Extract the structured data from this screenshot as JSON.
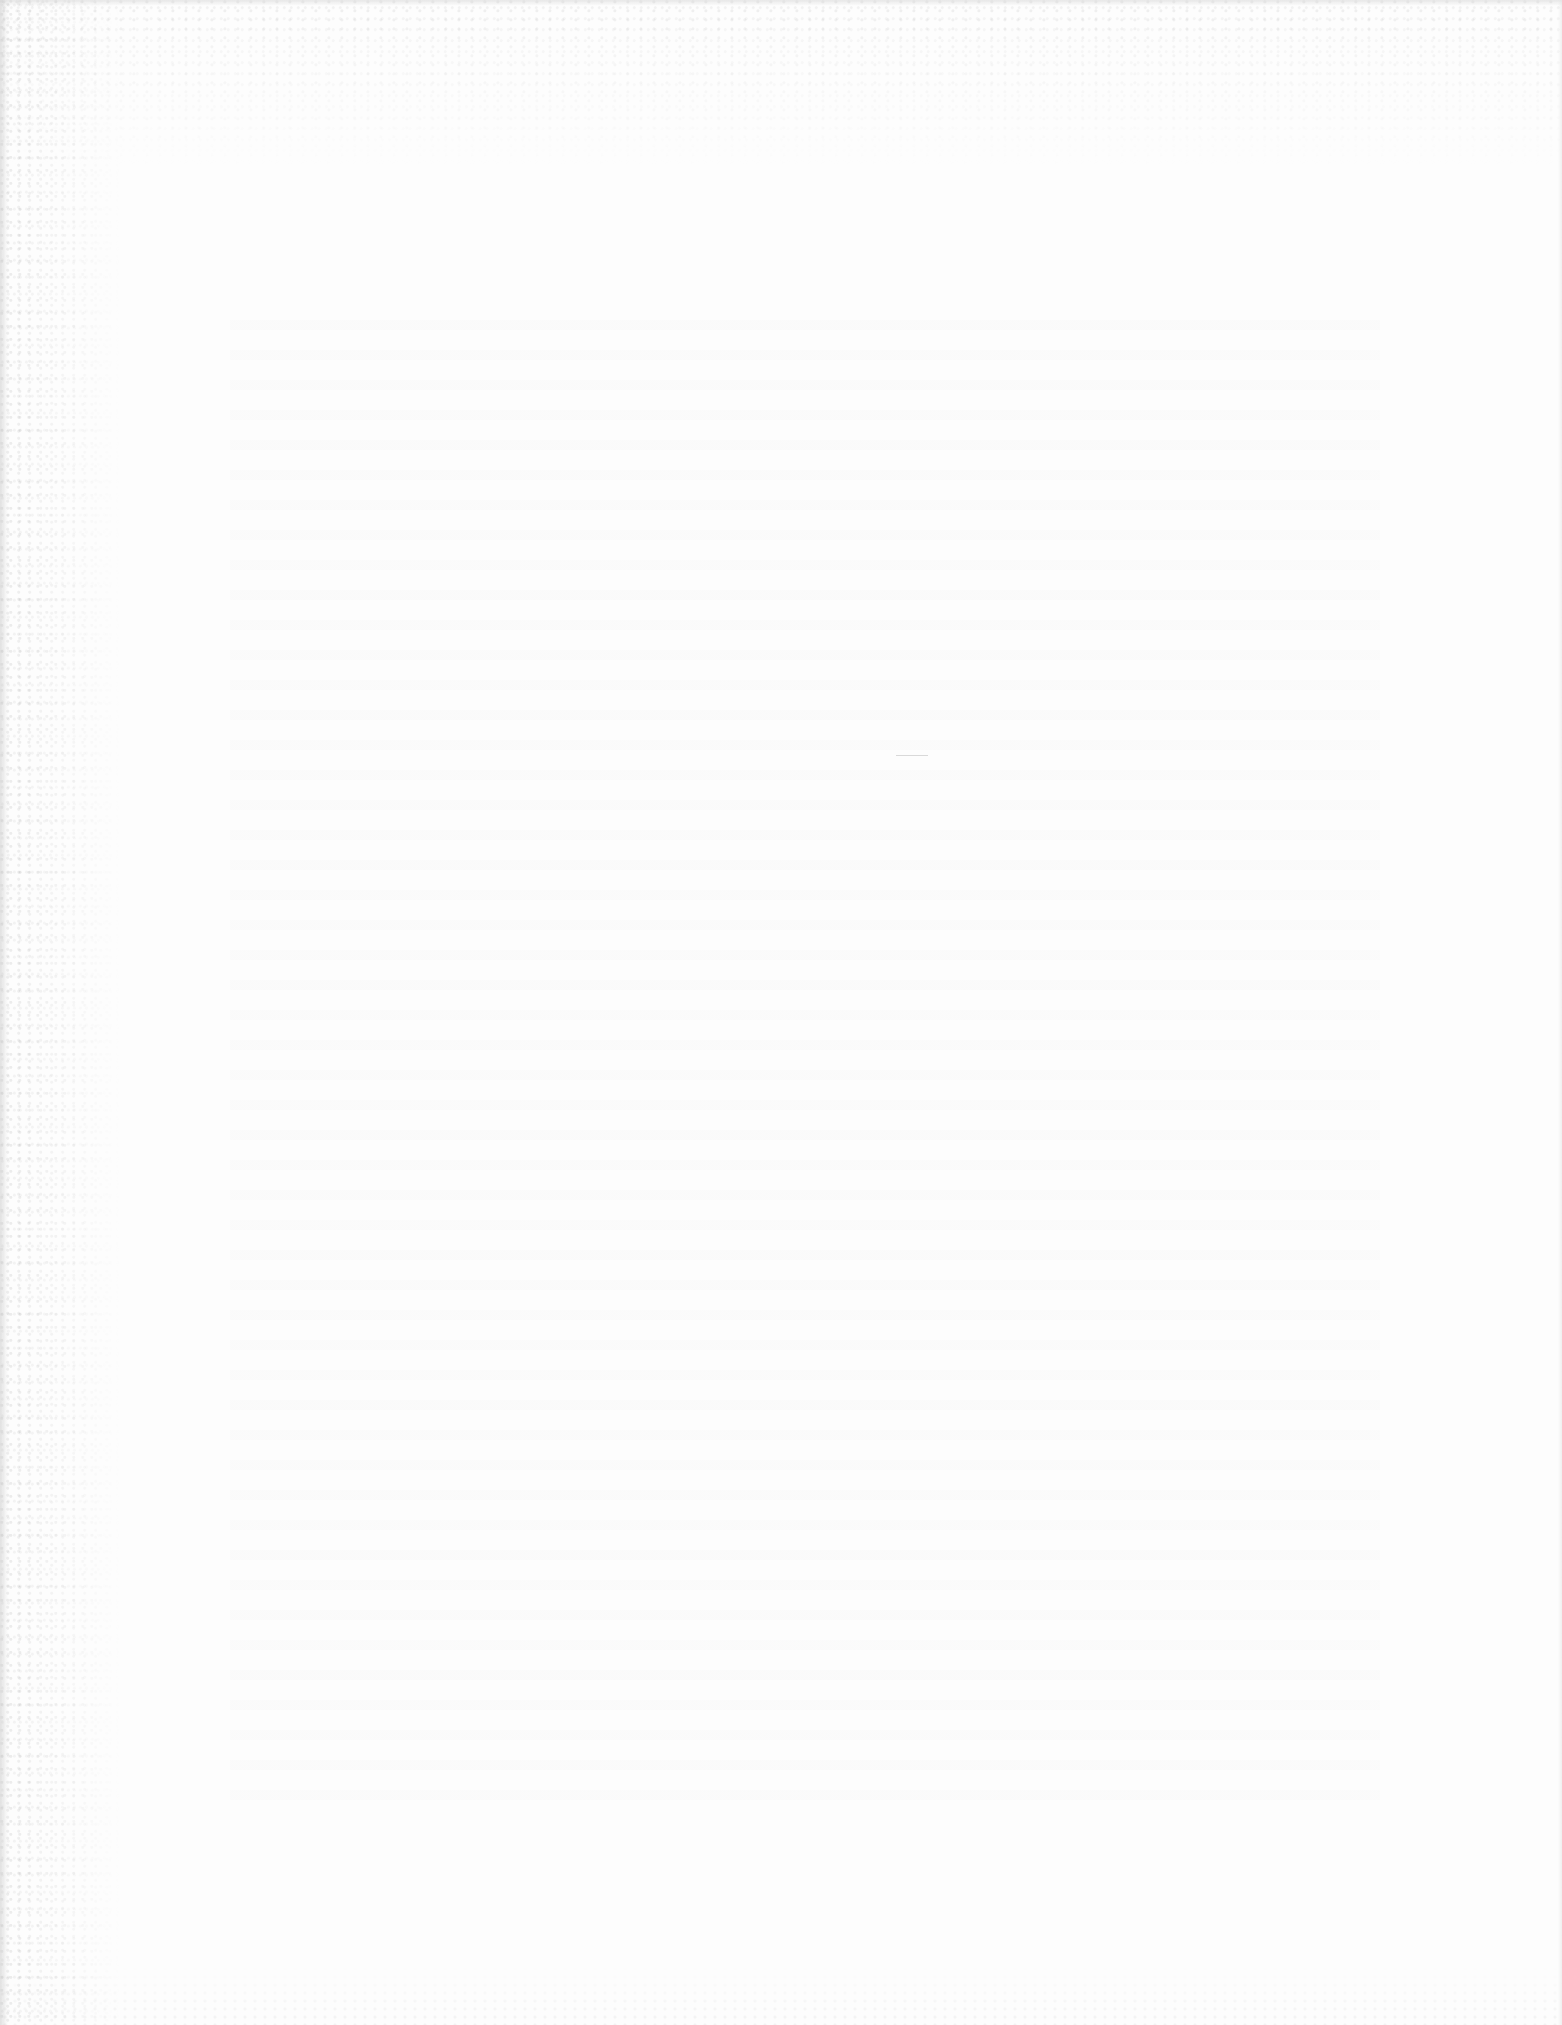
{
  "document": {
    "type": "scanned-page",
    "content": "",
    "is_blank": true,
    "width": 1562,
    "height": 2025
  },
  "colors": {
    "paper": "#fdfdfd",
    "edge_noise": "#969696",
    "stray_mark": "#d9d9d9"
  },
  "artifacts": {
    "scan_noise_edges": [
      "left",
      "top",
      "bottom"
    ],
    "show_through_text": "illegible",
    "stray_mark": {
      "x": 896,
      "y": 755,
      "width": 32,
      "height": 1
    }
  }
}
